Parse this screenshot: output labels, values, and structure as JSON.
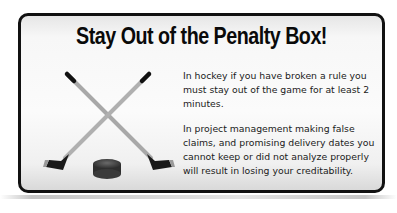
{
  "card": {
    "title": "Stay Out of the Penalty Box!",
    "paragraphs": [
      "In hockey if you have broken a rule you must stay out of the game for at least 2 minutes.",
      "In project management making false claims, and promising delivery dates you cannot keep or did not analyze properly will result in losing your creditability."
    ],
    "illustration": {
      "icons": [
        "hockey-stick-icon",
        "hockey-stick-icon",
        "hockey-puck-icon"
      ]
    }
  },
  "colors": {
    "border": "#111111",
    "background": "#f7f7f7",
    "text": "#1a1a1a"
  }
}
